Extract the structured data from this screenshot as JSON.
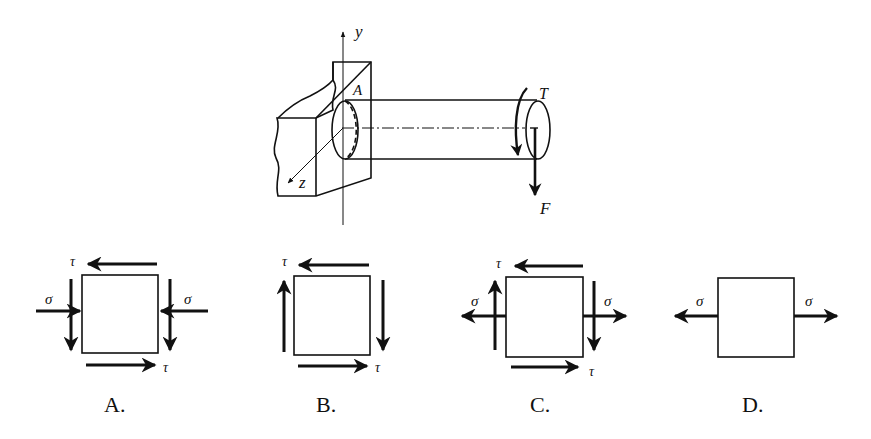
{
  "question": {
    "truncated_top_text": "▔▔▔▔ ▔▔ ▔▔▔▔▔▔ ▔▔ ▔▔▔▔▔ ▔▔▔"
  },
  "main_figure": {
    "labels": {
      "y_axis": "y",
      "z_axis": "z",
      "point": "A",
      "torque": "T",
      "force": "F"
    }
  },
  "options": [
    {
      "label": "A.",
      "stresses": [
        "τ",
        "σ",
        "σ",
        "τ"
      ],
      "description": "shear τ + compressive σ"
    },
    {
      "label": "B.",
      "stresses": [
        "τ",
        "τ"
      ],
      "description": "pure shear τ"
    },
    {
      "label": "C.",
      "stresses": [
        "τ",
        "σ",
        "σ",
        "τ"
      ],
      "description": "shear τ + tensile σ"
    },
    {
      "label": "D.",
      "stresses": [
        "σ",
        "σ"
      ],
      "description": "pure tensile σ"
    }
  ],
  "colors": {
    "ink": "#111111",
    "background": "#ffffff"
  }
}
